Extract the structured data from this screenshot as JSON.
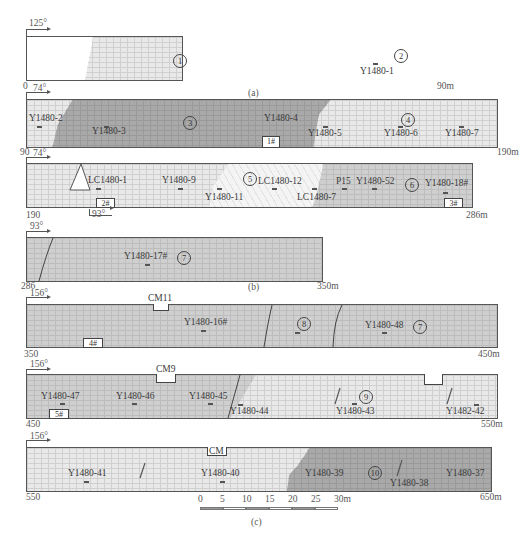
{
  "figure": {
    "panel_labels": {
      "a": "(a)",
      "b": "(b)",
      "c": "(c)"
    },
    "rows": [
      {
        "id": "row1",
        "dip": "125°",
        "start": "0",
        "end": "90m",
        "units": [
          {
            "num": "1"
          },
          {
            "num": "2"
          }
        ],
        "samples": [
          "Y1480-1"
        ]
      },
      {
        "id": "row2",
        "dip": "74°",
        "start": "90",
        "end": "190m",
        "units": [
          {
            "num": "3"
          },
          {
            "num": "4"
          }
        ],
        "samples": [
          "Y1480-2",
          "Y1480-3",
          "Y1480-4",
          "Y1480-5",
          "Y1480-6",
          "Y1480-7"
        ],
        "boxes": [
          "1#"
        ]
      },
      {
        "id": "row3",
        "dip": "74°",
        "dip2": "93°",
        "start": "190",
        "end": "286m",
        "units": [
          {
            "num": "5"
          },
          {
            "num": "6"
          }
        ],
        "samples": [
          "LC1480-1",
          "Y1480-9",
          "Y1480-11",
          "LC1480-12",
          "LC1480-7",
          "P15",
          "Y1480-52",
          "Y1480-18#"
        ],
        "boxes": [
          "2#",
          "3#"
        ]
      },
      {
        "id": "row4",
        "dip": "93°",
        "start": "286",
        "end": "350m",
        "units": [
          {
            "num": "7"
          }
        ],
        "samples": [
          "Y1480-17#"
        ]
      },
      {
        "id": "row5",
        "dip": "156°",
        "start": "350",
        "end": "450m",
        "units": [
          {
            "num": "8"
          },
          {
            "num": "7"
          }
        ],
        "samples": [
          "Y1480-16#",
          "Y1480-48"
        ],
        "boxes": [
          "4#"
        ],
        "notches": [
          "CM11"
        ]
      },
      {
        "id": "row6",
        "dip": "156°",
        "start": "450",
        "end": "550m",
        "units": [
          {
            "num": "9"
          }
        ],
        "samples": [
          "Y1480-47",
          "Y1480-46",
          "Y1480-45",
          "Y1480-44",
          "Y1480-43",
          "Y1482-42"
        ],
        "boxes": [
          "5#"
        ],
        "notches": [
          "CM9"
        ]
      },
      {
        "id": "row7",
        "dip": "156°",
        "start": "550",
        "end": "650m",
        "units": [
          {
            "num": "10"
          }
        ],
        "samples": [
          "Y1480-41",
          "Y1480-40",
          "Y1480-39",
          "Y1480-38",
          "Y1480-37"
        ],
        "notches": [
          "CM"
        ]
      }
    ],
    "scale_bar": {
      "ticks": [
        "0",
        "5",
        "10",
        "15",
        "20",
        "25",
        "30m"
      ]
    },
    "colors": {
      "light_grid": "#e9e9e9",
      "mid_grid": "#cfcfcf",
      "dark_grid": "#a9a9a9",
      "wavy": "#f4f4f4",
      "outline": "#555555"
    }
  }
}
